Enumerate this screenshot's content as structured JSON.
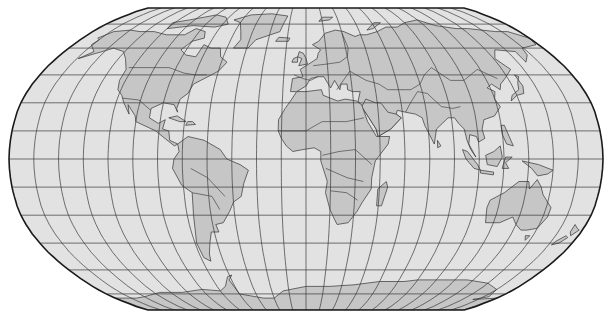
{
  "map": {
    "projection": "robinson",
    "graticule_step_deg": 15,
    "colors": {
      "background": "#ffffff",
      "ocean": "#e2e2e2",
      "land": "#c6c6c6",
      "graticule": "#3a3a3a",
      "border": "#333333",
      "outline": "#1a1a1a"
    },
    "frame": {
      "left": 9,
      "right": 603,
      "top": 8,
      "bottom": 310,
      "center_x": 306,
      "center_y": 159
    },
    "continents": [
      "north-america",
      "greenland",
      "south-america",
      "europe",
      "africa",
      "asia",
      "arabia",
      "india",
      "southeast-asia",
      "indonesia",
      "australia",
      "new-zealand",
      "madagascar",
      "japan",
      "antarctica",
      "uk",
      "iceland"
    ]
  }
}
